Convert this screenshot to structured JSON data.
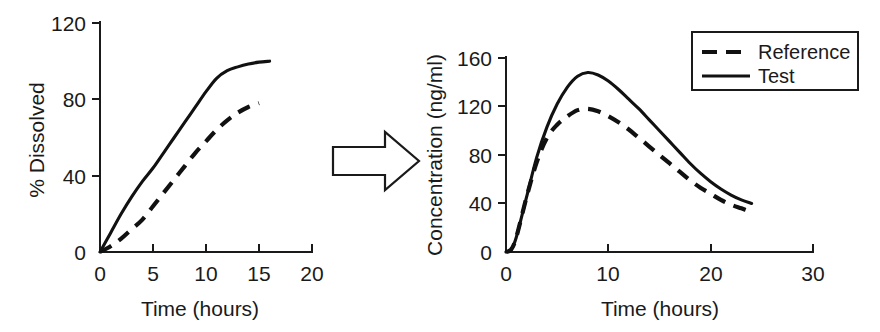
{
  "figure": {
    "arrow_icon": "right-block-arrow",
    "background_color": "#ffffff",
    "line_color": "#111111"
  },
  "chart_data": [
    {
      "id": "dissolution",
      "type": "line",
      "title": "",
      "xlabel": "Time (hours)",
      "ylabel": "% Dissolved",
      "xlim": [
        0,
        20
      ],
      "ylim": [
        0,
        120
      ],
      "xticks": [
        0,
        5,
        10,
        15,
        20
      ],
      "yticks": [
        0,
        40,
        80,
        120
      ],
      "xticklabels": [
        "0",
        "5",
        "10",
        "15",
        "20"
      ],
      "yticklabels": [
        "0",
        "40",
        "80",
        "120"
      ],
      "grid": false,
      "legend": "none",
      "series": [
        {
          "name": "Test",
          "style": "solid",
          "x": [
            0,
            1,
            2,
            3,
            4,
            5,
            6,
            7,
            8,
            9,
            10,
            11,
            12,
            13,
            14,
            15,
            16
          ],
          "values": [
            0,
            10,
            20,
            29,
            37,
            44,
            52,
            60,
            68,
            76,
            84,
            91,
            95,
            97,
            98.5,
            99.5,
            100
          ]
        },
        {
          "name": "Reference",
          "style": "dashed",
          "x": [
            0,
            1,
            2,
            3,
            4,
            5,
            6,
            7,
            8,
            9,
            10,
            11,
            12,
            13,
            14,
            15
          ],
          "values": [
            0,
            3,
            7,
            12,
            17,
            24,
            31,
            38,
            45,
            52,
            58,
            64,
            69,
            73,
            76,
            78
          ]
        }
      ]
    },
    {
      "id": "plasma-concentration",
      "type": "line",
      "title": "",
      "xlabel": "Time (hours)",
      "ylabel": "Concentration (ng/ml)",
      "xlim": [
        0,
        30
      ],
      "ylim": [
        0,
        160
      ],
      "xticks": [
        0,
        10,
        20,
        30
      ],
      "yticks": [
        0,
        40,
        80,
        120,
        160
      ],
      "xticklabels": [
        "0",
        "10",
        "20",
        "30"
      ],
      "yticklabels": [
        "0",
        "40",
        "80",
        "120",
        "160"
      ],
      "grid": false,
      "legend": "top-right",
      "legend_entries": [
        {
          "label": "Reference",
          "style": "dashed"
        },
        {
          "label": "Test",
          "style": "solid"
        }
      ],
      "series": [
        {
          "name": "Test",
          "style": "solid",
          "x": [
            0,
            0.5,
            1,
            2,
            3,
            4,
            5,
            6,
            7,
            8,
            9,
            10,
            11,
            12,
            13,
            14,
            15,
            16,
            17,
            18,
            19,
            20,
            21,
            22,
            23,
            24
          ],
          "values": [
            0,
            2,
            12,
            45,
            78,
            103,
            122,
            136,
            145,
            148,
            146,
            141,
            134,
            126,
            118,
            109,
            100,
            91,
            82,
            73,
            65,
            58,
            52,
            47,
            43,
            40
          ]
        },
        {
          "name": "Reference",
          "style": "dashed",
          "x": [
            0,
            0.5,
            1,
            2,
            3,
            4,
            5,
            6,
            7,
            8,
            9,
            10,
            11,
            12,
            13,
            14,
            15,
            16,
            17,
            18,
            19,
            20,
            21,
            22,
            23,
            24
          ],
          "values": [
            0,
            2,
            12,
            45,
            74,
            94,
            105,
            112,
            117,
            118,
            116,
            112,
            107,
            101,
            94,
            87,
            80,
            73,
            66,
            59,
            53,
            48,
            43,
            39,
            36,
            33
          ]
        }
      ]
    }
  ]
}
